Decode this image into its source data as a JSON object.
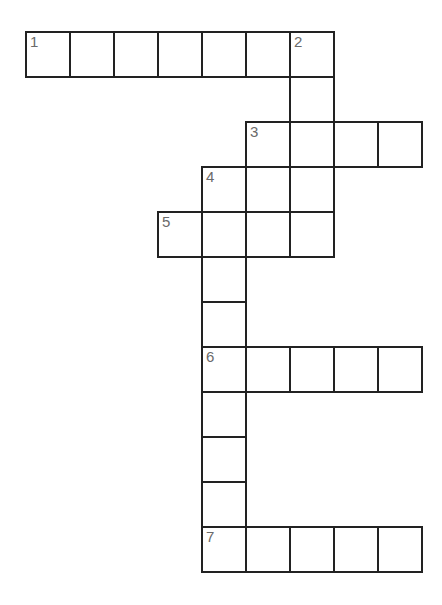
{
  "puzzle": {
    "type": "crossword",
    "cell_width": 44,
    "cell_height": 45,
    "origin_x": 26,
    "origin_y": 32,
    "line_color": "#222222",
    "number_color": "#6a6a6a",
    "clues": [
      {
        "number": "1",
        "direction": "across",
        "row": 0,
        "col": 0,
        "length": 7
      },
      {
        "number": "2",
        "direction": "down",
        "row": 0,
        "col": 6,
        "length": 5
      },
      {
        "number": "3",
        "direction": "across",
        "row": 2,
        "col": 5,
        "length": 4
      },
      {
        "number": "4",
        "direction": "down",
        "row": 3,
        "col": 4,
        "length": 9
      },
      {
        "number": "5",
        "direction": "across",
        "row": 4,
        "col": 3,
        "length": 4
      },
      {
        "number": "6",
        "direction": "across",
        "row": 7,
        "col": 4,
        "length": 5
      },
      {
        "number": "7",
        "direction": "across",
        "row": 11,
        "col": 4,
        "length": 5
      }
    ]
  }
}
